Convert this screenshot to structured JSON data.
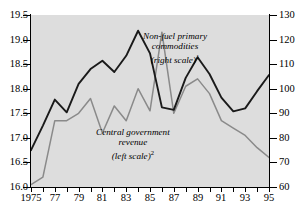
{
  "chart_data": {
    "type": "line",
    "title": "",
    "xlabel": "",
    "grid": false,
    "legend_position": "inline-annotations",
    "x": [
      1975,
      1976,
      1977,
      1978,
      1979,
      1980,
      1981,
      1982,
      1983,
      1984,
      1985,
      1986,
      1987,
      1988,
      1989,
      1990,
      1991,
      1992,
      1993,
      1994,
      1995
    ],
    "x_tick_labels": [
      "1975",
      "77",
      "79",
      "81",
      "83",
      "85",
      "87",
      "89",
      "91",
      "93",
      "95"
    ],
    "x_tick_values": [
      1975,
      1977,
      1979,
      1981,
      1983,
      1985,
      1987,
      1989,
      1991,
      1993,
      1995
    ],
    "left_axis": {
      "label": "Central government revenue (left scale)",
      "ylim": [
        16.0,
        19.5
      ],
      "ticks": [
        "16.0",
        "16.5",
        "17.0",
        "17.5",
        "18.0",
        "18.5",
        "19.0",
        "19.5"
      ],
      "tick_values": [
        16.0,
        16.5,
        17.0,
        17.5,
        18.0,
        18.5,
        19.0,
        19.5
      ]
    },
    "right_axis": {
      "label": "Non-fuel primary commodities (right scale)",
      "ylim": [
        60,
        130
      ],
      "ticks": [
        "60",
        "70",
        "80",
        "90",
        "100",
        "110",
        "120",
        "130"
      ],
      "tick_values": [
        60,
        70,
        80,
        90,
        100,
        110,
        120,
        130
      ]
    },
    "series": [
      {
        "name": "Central government revenue (left scale)",
        "axis": "left",
        "color": "#1a1a1a",
        "values": [
          16.75,
          17.25,
          17.78,
          17.52,
          18.1,
          18.4,
          18.57,
          18.34,
          18.67,
          19.18,
          18.72,
          17.62,
          17.57,
          18.22,
          18.64,
          18.3,
          17.82,
          17.54,
          17.6,
          17.95,
          18.28
        ]
      },
      {
        "name": "Non-fuel primary commodities (right scale)",
        "axis": "right",
        "color": "#8a8a8a",
        "values": [
          61,
          64,
          87,
          87,
          90,
          96,
          82,
          93,
          87,
          100,
          91,
          123,
          90,
          101,
          104,
          98,
          87,
          84,
          81,
          76,
          72
        ]
      }
    ],
    "annotations": [
      {
        "id": "commodities",
        "line1": "Non-fuel primary",
        "line2": "commodities",
        "line3": "(right scale)",
        "footnote": "1"
      },
      {
        "id": "revenue",
        "line1": "Central government",
        "line2": "revenue",
        "line3": "(left scale)",
        "footnote": "2"
      }
    ]
  },
  "style": {
    "plot_background": "#dddddd",
    "page_background": "#ffffff",
    "axis_color": "#000000"
  }
}
